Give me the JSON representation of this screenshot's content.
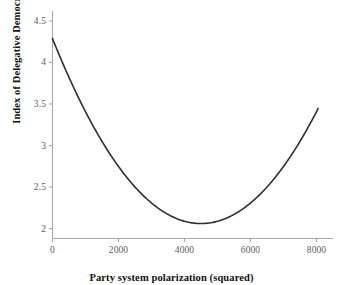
{
  "chart_data": {
    "type": "line",
    "title": "",
    "subtitle": "",
    "xlabel": "Party system polarization (squared)",
    "ylabel": "Index of Delegative Democracy",
    "xlim": [
      0,
      8500
    ],
    "ylim": [
      1.88,
      4.62
    ],
    "xticks": [
      0,
      2000,
      4000,
      6000,
      8000
    ],
    "xtick_labels": [
      "0",
      "2000",
      "4000",
      "6000",
      "8000"
    ],
    "yticks": [
      2,
      2.5,
      3,
      3.5,
      4,
      4.5
    ],
    "ytick_labels": [
      "2",
      "2.5",
      "3",
      "3.5",
      "4",
      "4.5"
    ],
    "grid": false,
    "legend": null,
    "annotations": [],
    "series": [
      {
        "name": "Predicted Index of Delegative Democracy",
        "curve": "quadratic",
        "vertex_x": 4500,
        "vertex_y": 2.06,
        "coefficient_a": 1.1e-07,
        "color": "#2f2f2f",
        "line_width": 1.6,
        "x": [
          0,
          250,
          500,
          750,
          1000,
          1250,
          1500,
          1750,
          2000,
          2250,
          2500,
          2750,
          3000,
          3250,
          3500,
          3750,
          4000,
          4250,
          4500,
          4750,
          5000,
          5250,
          5500,
          5750,
          6000,
          6250,
          6500,
          6750,
          7000,
          7250,
          7500,
          7750,
          8050
        ],
        "y": [
          4.29,
          4.17,
          4.06,
          3.95,
          3.85,
          3.74,
          3.65,
          3.55,
          3.46,
          3.38,
          3.3,
          3.22,
          3.14,
          3.07,
          3.01,
          2.94,
          2.89,
          2.83,
          2.78,
          2.74,
          2.7,
          2.66,
          2.63,
          2.6,
          2.58,
          2.56,
          2.55,
          2.54,
          2.53,
          2.53,
          2.53,
          2.54,
          2.55
        ]
      }
    ]
  },
  "axes": {
    "axis_color": "#a8a8a8",
    "tick_color": "#a8a8a8",
    "label_color": "#5c5c5c",
    "title_color": "#111111"
  },
  "background": {
    "color": "#ffffff"
  }
}
